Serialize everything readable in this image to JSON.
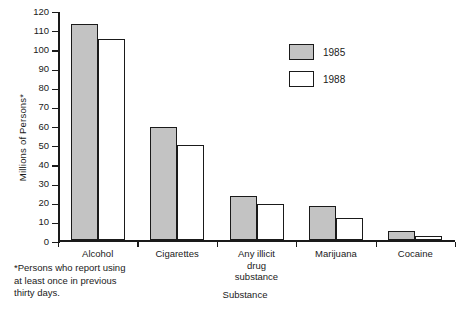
{
  "chart_data": {
    "type": "bar",
    "title": "",
    "xlabel": "Substance",
    "ylabel": "Millions of Persons*",
    "ylim": [
      0,
      120
    ],
    "ytick_step": 10,
    "yticks": [
      120,
      110,
      100,
      90,
      80,
      70,
      60,
      50,
      40,
      30,
      20,
      10,
      0
    ],
    "grid": false,
    "legend_position": "upper-right-inside",
    "categories": [
      "Alcohol",
      "Cigarettes",
      "Any illicit\ndrug\nsubstance",
      "Marijuana",
      "Cocaine"
    ],
    "series": [
      {
        "name": "1985",
        "color": "#c3c3c3",
        "values": [
          113,
          59,
          23,
          18,
          5
        ]
      },
      {
        "name": "1988",
        "color": "#ffffff",
        "values": [
          105,
          50,
          19,
          11.5,
          2.5
        ]
      }
    ],
    "footnote": "*Persons who report using\nat least once in previous\nthirty days."
  },
  "colors": {
    "bar_1985": "#c3c3c3",
    "bar_1988": "#ffffff",
    "outline": "#1a1a1a",
    "background": "#ffffff"
  }
}
